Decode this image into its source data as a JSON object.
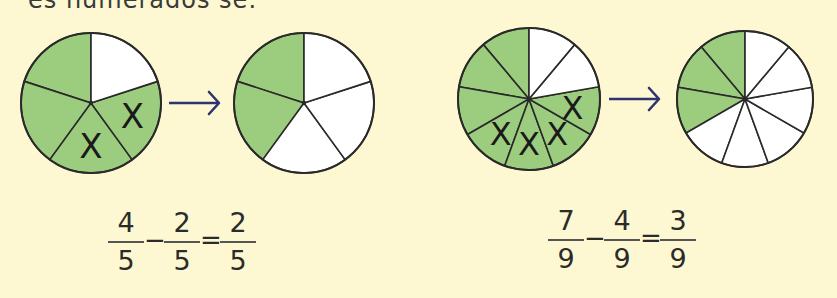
{
  "page": {
    "cut_title": "es numerados se:",
    "colors": {
      "background": "#fdf8d2",
      "shaded": "#9ccd7f",
      "unshaded": "#ffffff",
      "outline": "#2a2a2a",
      "arrow": "#2e3470"
    }
  },
  "examples": [
    {
      "name": "fifths",
      "before": {
        "parts": 5,
        "shaded": 4,
        "crossed": 2
      },
      "after": {
        "parts": 5,
        "shaded": 2
      },
      "cross_mark": "X",
      "arrow": "→",
      "equation": {
        "a": {
          "num": "4",
          "den": "5"
        },
        "op": "−",
        "b": {
          "num": "2",
          "den": "5"
        },
        "eq": "=",
        "c": {
          "num": "2",
          "den": "5"
        }
      }
    },
    {
      "name": "ninths",
      "before": {
        "parts": 9,
        "shaded": 7,
        "crossed": 4
      },
      "after": {
        "parts": 9,
        "shaded": 3
      },
      "cross_mark": "X",
      "arrow": "→",
      "equation": {
        "a": {
          "num": "7",
          "den": "9"
        },
        "op": "−",
        "b": {
          "num": "4",
          "den": "9"
        },
        "eq": "=",
        "c": {
          "num": "3",
          "den": "9"
        }
      }
    }
  ]
}
